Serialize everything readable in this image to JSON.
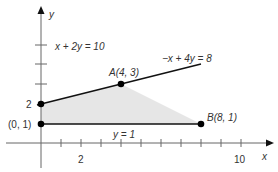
{
  "diagram": {
    "type": "linear-programming-feasible-region",
    "axes": {
      "x_label": "x",
      "y_label": "y",
      "x_tick_labels": [
        {
          "value": 2,
          "label": "2"
        },
        {
          "value": 10,
          "label": "10"
        }
      ],
      "y_tick_labels": [
        {
          "value": 2,
          "label": "2"
        }
      ],
      "x_range": [
        -2,
        11
      ],
      "y_range": [
        -1,
        7
      ]
    },
    "lines": [
      {
        "equation": "x + 2y = 10",
        "label": "x + 2y = 10"
      },
      {
        "equation": "-x + 4y = 8",
        "label": "−x + 4y = 8"
      },
      {
        "equation": "y = 1",
        "label": "y = 1"
      }
    ],
    "points": [
      {
        "name": "origin-intercept",
        "label": "(0, 1)",
        "x": 0,
        "y": 1
      },
      {
        "name": "y-intercept-2",
        "label": "2",
        "x": 0,
        "y": 2
      },
      {
        "name": "A",
        "label": "A(4, 3)",
        "x": 4,
        "y": 3
      },
      {
        "name": "B",
        "label": "B(8, 1)",
        "x": 8,
        "y": 1
      }
    ],
    "region": {
      "vertices": [
        [
          0,
          1
        ],
        [
          0,
          2
        ],
        [
          4,
          3
        ],
        [
          8,
          1
        ]
      ],
      "fill": "#e6e6e6"
    },
    "colors": {
      "axis": "#666666",
      "line": "#111111",
      "point": "#000000",
      "region": "#e6e6e6"
    }
  }
}
